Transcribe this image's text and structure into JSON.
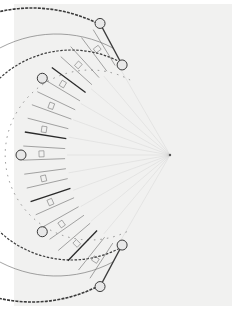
{
  "image": {
    "type": "architectural-floor-plan",
    "description": "Semi-circular (horseshoe) residential building floor plan, hand-drawn/scanned",
    "colors": {
      "background": "#ffffff",
      "paper": "#f1f1f0",
      "ink": "#3a3a3a",
      "faint_ink": "#b8b8b8"
    }
  },
  "plan": {
    "center": [
      170,
      155
    ],
    "outer_radius": 147,
    "inner_radius": 105,
    "arc_start_deg": 70,
    "arc_end_deg": 290,
    "stair_towers": 8,
    "dimension_labels": [
      "",
      "",
      "",
      "",
      "",
      ""
    ]
  }
}
